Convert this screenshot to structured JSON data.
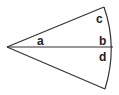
{
  "diagram": {
    "type": "circular-sector",
    "stroke_color": "#333333",
    "labels": {
      "a": "a",
      "b": "b",
      "c": "c",
      "d": "d"
    }
  }
}
